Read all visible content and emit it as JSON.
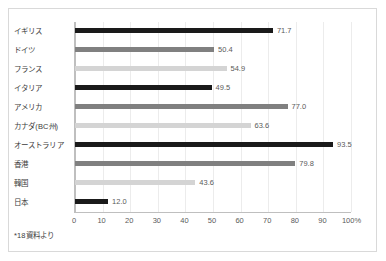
{
  "chart_data": {
    "type": "bar",
    "orientation": "horizontal",
    "title": "",
    "xlabel": "",
    "ylabel": "",
    "xlim": [
      0,
      100
    ],
    "grid": true,
    "legend": "none",
    "categories": [
      "イギリス",
      "ドイツ",
      "フランス",
      "イタリア",
      "アメリカ",
      "カナダ(BC州)",
      "オーストラリア",
      "香港",
      "韓国",
      "日本"
    ],
    "values": [
      71.7,
      50.4,
      54.9,
      49.5,
      77.0,
      63.6,
      93.5,
      79.8,
      43.6,
      12.0
    ],
    "value_labels": [
      "71.7",
      "50.4",
      "54.9",
      "49.5",
      "77.0",
      "63.6",
      "93.5",
      "79.8",
      "43.6",
      "12.0"
    ],
    "bar_colors": [
      "#1a1a1a",
      "#808080",
      "#d4d4d4",
      "#1a1a1a",
      "#808080",
      "#d4d4d4",
      "#1a1a1a",
      "#808080",
      "#d4d4d4",
      "#1a1a1a"
    ],
    "bar_color_classes": [
      "c-dark",
      "c-mid",
      "c-light",
      "c-dark",
      "c-mid",
      "c-light",
      "c-dark",
      "c-mid",
      "c-light",
      "c-dark"
    ],
    "xticks": [
      0,
      10,
      20,
      30,
      40,
      50,
      60,
      70,
      80,
      90,
      100
    ],
    "xtick_labels": [
      "0",
      "10",
      "20",
      "30",
      "40",
      "50",
      "60",
      "70",
      "80",
      "90",
      "100%"
    ]
  },
  "footnote": "*18資料より",
  "colors": {
    "frame": "#d9d9d9",
    "axis": "#bfbfbf",
    "grid": "#ececec",
    "text": "#3d3d3d",
    "value_text": "#5a5a5a"
  }
}
